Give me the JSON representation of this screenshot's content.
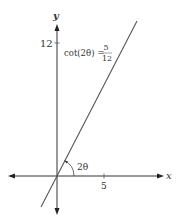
{
  "diagram": {
    "type": "coordinate-plane",
    "axes": {
      "x_label": "x",
      "y_label": "y",
      "x_ticks": [
        {
          "value": 5,
          "label": "5"
        }
      ],
      "y_ticks": [
        {
          "value": 12,
          "label": "12"
        }
      ]
    },
    "line": {
      "description": "line through origin with slope 12/5",
      "slope": "12/5"
    },
    "annotations": {
      "equation_lhs": "cot(2θ) =",
      "equation_numerator": "5",
      "equation_denominator": "12",
      "angle_label": "2θ"
    },
    "colors": {
      "axis": "#333333",
      "line": "#555555",
      "text": "#444444"
    }
  }
}
